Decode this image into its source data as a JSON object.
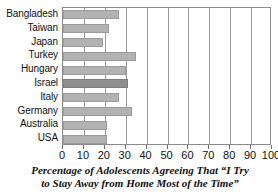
{
  "chart_data": {
    "type": "bar",
    "orientation": "horizontal",
    "caption_lines": [
      "Percentage of Adolescents Agreeing That “I Try",
      "to Stay Away from Home Most of the Time”"
    ],
    "xlabel": "",
    "ylabel": "",
    "xlim": [
      0,
      100
    ],
    "grid": true,
    "legend": null,
    "categories": [
      "Bangladesh",
      "Taiwan",
      "Japan",
      "Turkey",
      "Hungary",
      "Israel",
      "Italy",
      "Germany",
      "Australia",
      "USA"
    ],
    "values": [
      27,
      22,
      19,
      35,
      30,
      31,
      27,
      33,
      21,
      21
    ],
    "xticks": [
      0,
      10,
      20,
      30,
      40,
      50,
      60,
      70,
      80,
      90,
      100
    ],
    "xticklabels": [
      "0",
      "10",
      "20",
      "30",
      "40",
      "50",
      "60",
      "70",
      "80",
      "90",
      "100"
    ],
    "bar_color": "#b2b2b2",
    "bar_color_alt": "#8e8e8e",
    "axis_color": "#8b8b8b",
    "grid_color": "#9a9a9a",
    "text_color": "#111111",
    "background": "#ffffff"
  }
}
